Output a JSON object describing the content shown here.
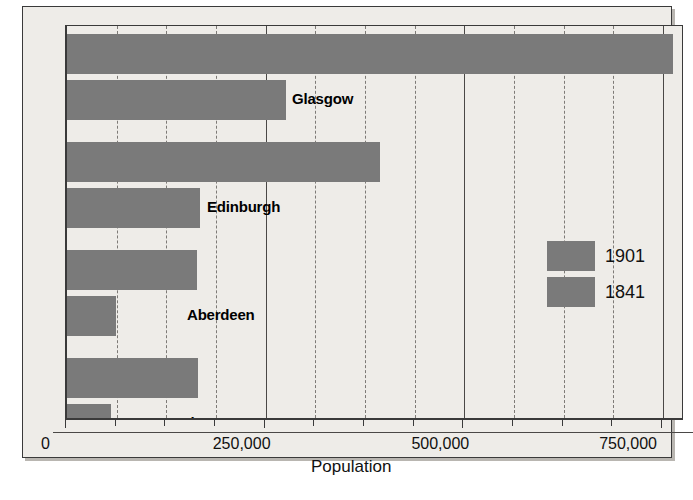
{
  "chart_data": {
    "type": "bar",
    "orientation": "horizontal",
    "title": "",
    "xlabel": "Population",
    "ylabel": "",
    "xlim": [
      0,
      775000
    ],
    "xticks": [
      0,
      250000,
      500000,
      750000
    ],
    "xticklabels": [
      "0",
      "250,000",
      "500,000",
      "750,000"
    ],
    "grid": true,
    "grid_axis": "x",
    "legend_position": "center-right",
    "categories": [
      "Glasgow",
      "Edinburgh",
      "Aberdeen",
      "Dundee"
    ],
    "series": [
      {
        "name": "1901",
        "values": [
          762000,
          394000,
          163000,
          165000
        ]
      },
      {
        "name": "1841",
        "values": [
          275000,
          167000,
          62000,
          55000
        ]
      }
    ],
    "bar_color": "#7a7a7a",
    "background_color": "#eeece8",
    "bars": [
      {
        "city": "Glasgow",
        "year": "1901",
        "value": 762000
      },
      {
        "city": "Glasgow",
        "year": "1841",
        "value": 275000
      },
      {
        "city": "Edinburgh",
        "year": "1901",
        "value": 394000
      },
      {
        "city": "Edinburgh",
        "year": "1841",
        "value": 167000
      },
      {
        "city": "Aberdeen",
        "year": "1901",
        "value": 163000
      },
      {
        "city": "Aberdeen",
        "year": "1841",
        "value": 62000
      },
      {
        "city": "Dundee",
        "year": "1901",
        "value": 165000
      },
      {
        "city": "Dundee",
        "year": "1841",
        "value": 55000
      }
    ]
  },
  "axis": {
    "xlabel": "Population",
    "ticks": [
      {
        "label": "0"
      },
      {
        "label": "250,000"
      },
      {
        "label": "500,000"
      },
      {
        "label": "750,000"
      }
    ]
  },
  "labels": {
    "glasgow": "Glasgow",
    "edinburgh": "Edinburgh",
    "aberdeen": "Aberdeen",
    "dundee": "Dundee"
  },
  "legend": {
    "entries": [
      {
        "label": "1901"
      },
      {
        "label": "1841"
      }
    ]
  }
}
